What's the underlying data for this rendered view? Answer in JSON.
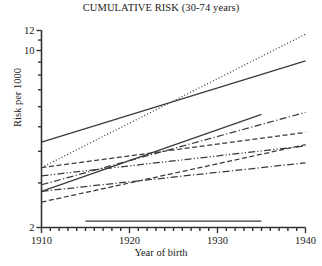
{
  "chart_data": {
    "type": "line",
    "title": "CUMULATIVE RISK (30-74 years)",
    "xlabel": "Year of birth",
    "ylabel": "Risk per 1000",
    "xlim": [
      1910,
      1940
    ],
    "ylim": [
      2,
      12
    ],
    "yscale": "log",
    "grid": false,
    "legend": "none",
    "x_ticks_major": [
      1910,
      1920,
      1930,
      1940
    ],
    "x_tick_labels": [
      "1910",
      "1920",
      "1930",
      "1940"
    ],
    "x_tick_minor_step": 1,
    "y_ticks_labeled": [
      2,
      10,
      12
    ],
    "y_tick_labels": [
      "2",
      "10",
      "12"
    ],
    "y_ticks_minor": [
      3,
      4,
      5,
      6,
      7,
      8,
      9,
      11
    ],
    "series": [
      {
        "name": "series-1-dotted-steep",
        "style": "dotted",
        "x": [
          1910,
          1940
        ],
        "values": [
          3.45,
          11.6
        ]
      },
      {
        "name": "series-2-solid-steep",
        "style": "solid",
        "x": [
          1910,
          1940
        ],
        "values": [
          4.35,
          9.1
        ]
      },
      {
        "name": "series-3-solid-rising-mid",
        "style": "solid",
        "x": [
          1910,
          1935
        ],
        "values": [
          2.78,
          5.6
        ]
      },
      {
        "name": "series-4-dashdot-rising",
        "style": "dashdot",
        "x": [
          1910,
          1940
        ],
        "values": [
          2.95,
          5.7
        ]
      },
      {
        "name": "series-5-dashed-flat-upper",
        "style": "dashed",
        "x": [
          1910,
          1940
        ],
        "values": [
          3.45,
          4.75
        ]
      },
      {
        "name": "series-6-dashdotdot-flat",
        "style": "dashdotdot",
        "x": [
          1910,
          1940
        ],
        "values": [
          3.2,
          4.2
        ]
      },
      {
        "name": "series-7-dashed-rising-low",
        "style": "dashed",
        "x": [
          1910,
          1940
        ],
        "values": [
          2.52,
          4.25
        ]
      },
      {
        "name": "series-8-dashdot-flat-low",
        "style": "dashdot",
        "x": [
          1910,
          1940
        ],
        "values": [
          2.78,
          3.6
        ]
      },
      {
        "name": "series-9-solid-flat-bottom",
        "style": "solid",
        "x": [
          1915,
          1935
        ],
        "values": [
          2.12,
          2.12
        ]
      }
    ]
  }
}
